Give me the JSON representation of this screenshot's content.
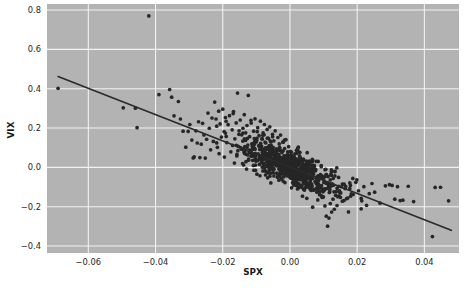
{
  "figure": {
    "background_color": "#ffffff",
    "axes_facecolor": "#b3b3b3",
    "grid_color": "#f2f2f2",
    "point_color": "#262626",
    "line_color": "#2b2b2b"
  },
  "axis": {
    "x_title": "SPX",
    "y_title": "VIX",
    "x_ticks": [
      "-0.06",
      "-0.04",
      "-0.02",
      "0.00",
      "0.02",
      "0.04"
    ],
    "y_ticks": [
      "0.8",
      "0.6",
      "0.4",
      "0.2",
      "0.0",
      "-0.2",
      "-0.4"
    ]
  },
  "chart_data": {
    "type": "scatter",
    "title": "",
    "xlabel": "SPX",
    "ylabel": "VIX",
    "xlim": [
      -0.0723,
      0.0503
    ],
    "ylim": [
      -0.4355,
      0.8308
    ],
    "xticks": [
      -0.06,
      -0.04,
      -0.02,
      0.0,
      0.02,
      0.04
    ],
    "yticks": [
      -0.4,
      -0.2,
      0.0,
      0.2,
      0.4,
      0.6,
      0.8
    ],
    "grid": true,
    "legend": null,
    "annotations": [],
    "trendline": {
      "type": "linear-regression",
      "x_start": -0.069,
      "y_start": 0.462,
      "x_end": 0.048,
      "y_end": -0.32,
      "slope": -6.68,
      "intercept": 0.001
    },
    "correlation": -0.73,
    "n_points": 912,
    "notable_outlier": {
      "x": -0.042,
      "y": 0.77
    },
    "points": [
      [
        -0.069,
        0.402
      ],
      [
        -0.042,
        0.77
      ],
      [
        -0.0496,
        0.303
      ],
      [
        -0.046,
        0.301
      ],
      [
        -0.0455,
        0.202
      ],
      [
        -0.039,
        0.37
      ],
      [
        -0.0358,
        0.396
      ],
      [
        -0.0352,
        0.357
      ],
      [
        -0.0345,
        0.262
      ],
      [
        -0.0332,
        0.335
      ],
      [
        -0.0326,
        0.246
      ],
      [
        -0.0318,
        0.184
      ],
      [
        -0.031,
        0.1025
      ],
      [
        -0.0303,
        0.183
      ],
      [
        -0.0298,
        0.218
      ],
      [
        -0.0292,
        0.139
      ],
      [
        -0.0288,
        0.048
      ],
      [
        -0.0285,
        0.053
      ],
      [
        -0.028,
        0.186
      ],
      [
        -0.0276,
        0.124
      ],
      [
        -0.0272,
        0.232
      ],
      [
        -0.0268,
        0.05
      ],
      [
        -0.0264,
        0.118
      ],
      [
        -0.026,
        0.224
      ],
      [
        -0.0256,
        0.165
      ],
      [
        -0.0252,
        0.047
      ],
      [
        -0.0248,
        0.143
      ],
      [
        -0.0244,
        0.276
      ],
      [
        -0.024,
        0.199
      ],
      [
        -0.0236,
        0.089
      ],
      [
        -0.0232,
        0.251
      ],
      [
        -0.0228,
        0.132
      ],
      [
        -0.0224,
        0.332
      ],
      [
        -0.022,
        0.246
      ],
      [
        -0.0216,
        0.102
      ],
      [
        -0.0212,
        0.286
      ],
      [
        -0.0208,
        0.221
      ],
      [
        -0.0204,
        0.154
      ],
      [
        -0.02,
        0.296
      ],
      [
        -0.0196,
        0.182
      ],
      [
        -0.0192,
        0.253
      ],
      [
        -0.0188,
        0.126
      ],
      [
        -0.0184,
        0.217
      ],
      [
        -0.018,
        0.263
      ],
      [
        -0.0176,
        0.079
      ],
      [
        -0.0172,
        0.191
      ],
      [
        -0.0168,
        0.284
      ],
      [
        -0.0164,
        0.145
      ],
      [
        -0.016,
        0.226
      ],
      [
        -0.0156,
        0.378
      ],
      [
        -0.0152,
        0.168
      ],
      [
        -0.0148,
        0.241
      ],
      [
        -0.0144,
        0.092
      ],
      [
        -0.014,
        0.199
      ],
      [
        -0.0136,
        0.268
      ],
      [
        -0.0132,
        0.137
      ],
      [
        -0.0128,
        0.213
      ],
      [
        -0.0124,
        0.366
      ],
      [
        -0.012,
        0.156
      ],
      [
        -0.0116,
        0.239
      ],
      [
        -0.0112,
        0.108
      ],
      [
        -0.0108,
        0.184
      ],
      [
        -0.0104,
        0.247
      ],
      [
        -0.01,
        0.129
      ],
      [
        -0.0096,
        0.202
      ],
      [
        -0.0092,
        0.161
      ],
      [
        -0.0088,
        0.235
      ],
      [
        -0.0084,
        0.096
      ],
      [
        -0.008,
        0.175
      ],
      [
        -0.0076,
        0.218
      ],
      [
        -0.0072,
        0.124
      ],
      [
        -0.0068,
        0.193
      ],
      [
        -0.0064,
        0.147
      ],
      [
        -0.006,
        0.206
      ],
      [
        -0.0056,
        0.112
      ],
      [
        -0.0052,
        0.168
      ],
      [
        -0.0048,
        0.135
      ],
      [
        -0.0044,
        0.186
      ],
      [
        -0.004,
        0.088
      ],
      [
        -0.0036,
        0.152
      ],
      [
        -0.0032,
        0.119
      ],
      [
        -0.0028,
        0.164
      ],
      [
        -0.0024,
        0.075
      ],
      [
        -0.002,
        0.128
      ],
      [
        -0.0016,
        0.096
      ],
      [
        -0.0012,
        0.141
      ],
      [
        -0.0008,
        0.062
      ],
      [
        -0.0004,
        0.105
      ],
      [
        0.0,
        0.034
      ],
      [
        0.0004,
        0.078
      ],
      [
        0.0008,
        0.021
      ],
      [
        0.0012,
        0.056
      ],
      [
        0.0016,
        -0.008
      ],
      [
        0.002,
        0.039
      ],
      [
        0.0024,
        -0.024
      ],
      [
        0.0028,
        0.018
      ],
      [
        0.0032,
        -0.041
      ],
      [
        0.0036,
        0.002
      ],
      [
        0.004,
        -0.056
      ],
      [
        0.0044,
        -0.015
      ],
      [
        0.0048,
        -0.069
      ],
      [
        0.0052,
        -0.028
      ],
      [
        0.0056,
        -0.084
      ],
      [
        0.006,
        -0.043
      ],
      [
        0.0064,
        -0.098
      ],
      [
        0.0068,
        -0.057
      ],
      [
        0.0072,
        -0.112
      ],
      [
        0.0076,
        -0.071
      ],
      [
        0.008,
        -0.126
      ],
      [
        0.0084,
        -0.085
      ],
      [
        0.0088,
        -0.139
      ],
      [
        0.0092,
        -0.099
      ],
      [
        0.0096,
        -0.153
      ],
      [
        0.01,
        -0.113
      ],
      [
        0.0104,
        -0.196
      ],
      [
        0.0108,
        -0.248
      ],
      [
        0.0112,
        -0.299
      ],
      [
        0.0116,
        -0.258
      ],
      [
        0.012,
        -0.184
      ],
      [
        0.0124,
        -0.227
      ],
      [
        0.0128,
        -0.162
      ],
      [
        0.0132,
        -0.213
      ],
      [
        0.0136,
        -0.142
      ],
      [
        0.014,
        -0.194
      ],
      [
        0.0148,
        -0.126
      ],
      [
        0.0156,
        -0.172
      ],
      [
        0.0164,
        -0.108
      ],
      [
        0.0172,
        -0.156
      ],
      [
        0.018,
        -0.092
      ],
      [
        0.0188,
        -0.138
      ],
      [
        0.0196,
        -0.076
      ],
      [
        0.0204,
        -0.119
      ],
      [
        0.0212,
        -0.158
      ],
      [
        0.022,
        -0.098
      ],
      [
        0.0228,
        -0.193
      ],
      [
        0.0236,
        -0.134
      ],
      [
        0.0244,
        -0.082
      ],
      [
        0.0252,
        -0.126
      ],
      [
        0.0268,
        -0.182
      ],
      [
        0.0284,
        -0.094
      ],
      [
        0.0296,
        -0.088
      ],
      [
        0.0304,
        -0.092
      ],
      [
        0.0312,
        -0.162
      ],
      [
        0.032,
        -0.098
      ],
      [
        0.0328,
        -0.169
      ],
      [
        0.0336,
        -0.167
      ],
      [
        0.0352,
        -0.096
      ],
      [
        0.0368,
        -0.174
      ],
      [
        0.0424,
        -0.352
      ],
      [
        0.0432,
        -0.102
      ],
      [
        0.0448,
        -0.101
      ],
      [
        0.0472,
        -0.17
      ]
    ]
  }
}
